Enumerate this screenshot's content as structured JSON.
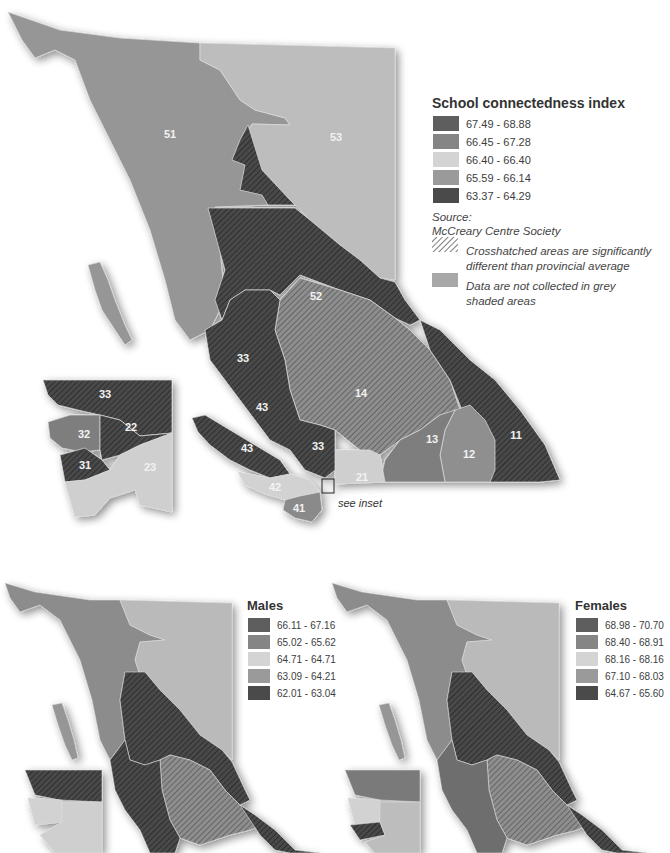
{
  "main_map": {
    "legend": {
      "title": "School connectedness index",
      "items": [
        {
          "range": "67.49 - 68.88",
          "color": "#5e5e5e"
        },
        {
          "range": "66.45 - 67.28",
          "color": "#858585"
        },
        {
          "range": "66.40 - 66.40",
          "color": "#d4d4d4"
        },
        {
          "range": "65.59 - 66.14",
          "color": "#9a9a9a"
        },
        {
          "range": "63.37 - 64.29",
          "color": "#4a4a4a"
        }
      ],
      "source_label": "Source:",
      "source_name": "McCreary Centre Society",
      "crosshatch_note": "Crosshatched areas are significantly different than provincial average",
      "grey_note": "Data are not collected in grey shaded areas"
    },
    "region_labels": [
      {
        "id": "51",
        "x": 170,
        "y": 138
      },
      {
        "id": "53",
        "x": 336,
        "y": 141
      },
      {
        "id": "52",
        "x": 316,
        "y": 300
      },
      {
        "id": "33",
        "x": 243,
        "y": 362
      },
      {
        "id": "14",
        "x": 361,
        "y": 397
      },
      {
        "id": "43",
        "x": 262,
        "y": 411
      },
      {
        "id": "43",
        "x": 247,
        "y": 450
      },
      {
        "id": "33",
        "x": 318,
        "y": 449
      },
      {
        "id": "13",
        "x": 432,
        "y": 441
      },
      {
        "id": "12",
        "x": 469,
        "y": 456
      },
      {
        "id": "11",
        "x": 516,
        "y": 437
      },
      {
        "id": "21",
        "x": 362,
        "y": 478
      },
      {
        "id": "42",
        "x": 275,
        "y": 488
      },
      {
        "id": "41",
        "x": 299,
        "y": 509
      }
    ],
    "inset_labels": [
      {
        "id": "33",
        "x": 105,
        "y": 396
      },
      {
        "id": "32",
        "x": 84,
        "y": 436
      },
      {
        "id": "22",
        "x": 131,
        "y": 429
      },
      {
        "id": "31",
        "x": 85,
        "y": 467
      },
      {
        "id": "23",
        "x": 150,
        "y": 469
      }
    ],
    "see_inset": "see inset"
  },
  "males_map": {
    "legend": {
      "title": "Males",
      "items": [
        {
          "range": "66.11 - 67.16",
          "color": "#5e5e5e"
        },
        {
          "range": "65.02 - 65.62",
          "color": "#858585"
        },
        {
          "range": "64.71 - 64.71",
          "color": "#d4d4d4"
        },
        {
          "range": "63.09 - 64.21",
          "color": "#9a9a9a"
        },
        {
          "range": "62.01 - 63.04",
          "color": "#4a4a4a"
        }
      ]
    }
  },
  "females_map": {
    "legend": {
      "title": "Females",
      "items": [
        {
          "range": "68.98 - 70.70",
          "color": "#5e5e5e"
        },
        {
          "range": "68.40 - 68.91",
          "color": "#858585"
        },
        {
          "range": "68.16 - 68.16",
          "color": "#d4d4d4"
        },
        {
          "range": "67.10 - 68.03",
          "color": "#9a9a9a"
        },
        {
          "range": "64.67 - 65.60",
          "color": "#4a4a4a"
        }
      ]
    }
  },
  "colors": {
    "grey_no_data": "#a8a8a8",
    "northwest": "#969696",
    "northeast": "#bdbdbd",
    "dark": "#4a4a4a",
    "mid_hatch": "#8a8a8a",
    "light": "#d0d0d0"
  }
}
